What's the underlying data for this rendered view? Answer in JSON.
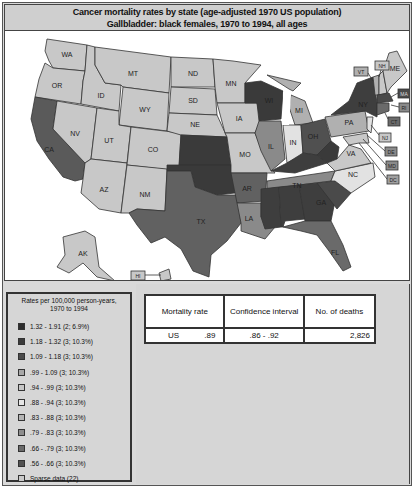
{
  "title": {
    "line1": "Cancer mortality rates by state (age-adjusted 1970 US population)",
    "line2": "Gallbladder:  black females, 1970 to 1994, all ages"
  },
  "colors": {
    "bin1": "#3a3a3a",
    "bin2": "#454545",
    "bin3": "#555555",
    "bin4": "#a6a6a6",
    "bin5": "#c4c4c4",
    "bin6": "#dedede",
    "bin7": "#b0b0b0",
    "bin8": "#8c8c8c",
    "bin9": "#6a6a6a",
    "bin10": "#505050",
    "sparse": "#c8c8c8",
    "background": "#d9d9d9"
  },
  "legend": {
    "title_line1": "Rates per 100,000 person-years,",
    "title_line2": "1970 to 1994",
    "items": [
      {
        "label": "1.32 - 1.91 (2; 6.9%)",
        "color": "#2e2e2e"
      },
      {
        "label": "1.18 - 1.32 (3; 10.3%)",
        "color": "#3c3c3c"
      },
      {
        "label": "1.09 - 1.18 (3; 10.3%)",
        "color": "#4c4c4c"
      },
      {
        "label": ".99 - 1.09 (3; 10.3%)",
        "color": "#a8a8a8"
      },
      {
        "label": ".94 - .99 (3; 10.3%)",
        "color": "#c6c6c6"
      },
      {
        "label": ".88 - .94 (3; 10.3%)",
        "color": "#e6e6e6"
      },
      {
        "label": ".83 - .88 (3; 10.3%)",
        "color": "#b4b4b4"
      },
      {
        "label": ".79 - .83 (3; 10.3%)",
        "color": "#8e8e8e"
      },
      {
        "label": ".66 - .79 (3; 10.3%)",
        "color": "#6a6a6a"
      },
      {
        "label": ".56 - .66 (3; 10.3%)",
        "color": "#525252"
      },
      {
        "label": "Sparse data (22)",
        "color": "#cacaca"
      }
    ]
  },
  "stats": {
    "headers": {
      "rate": "Mortality rate",
      "ci": "Confidence interval",
      "deaths": "No. of deaths"
    },
    "row": {
      "region": "US",
      "rate": ".89",
      "ci": ".86 - .92",
      "deaths": "2,826"
    }
  },
  "map": {
    "states": [
      {
        "abbr": "WA"
      },
      {
        "abbr": "OR"
      },
      {
        "abbr": "CA"
      },
      {
        "abbr": "ID"
      },
      {
        "abbr": "NV"
      },
      {
        "abbr": "MT"
      },
      {
        "abbr": "WY"
      },
      {
        "abbr": "UT"
      },
      {
        "abbr": "AZ"
      },
      {
        "abbr": "CO"
      },
      {
        "abbr": "NM"
      },
      {
        "abbr": "ND"
      },
      {
        "abbr": "SD"
      },
      {
        "abbr": "NE"
      },
      {
        "abbr": "KS"
      },
      {
        "abbr": "OK"
      },
      {
        "abbr": "TX"
      },
      {
        "abbr": "MN"
      },
      {
        "abbr": "IA"
      },
      {
        "abbr": "MO"
      },
      {
        "abbr": "AR"
      },
      {
        "abbr": "LA"
      },
      {
        "abbr": "WI"
      },
      {
        "abbr": "IL"
      },
      {
        "abbr": "MI"
      },
      {
        "abbr": "IN"
      },
      {
        "abbr": "OH"
      },
      {
        "abbr": "KY"
      },
      {
        "abbr": "TN"
      },
      {
        "abbr": "MS"
      },
      {
        "abbr": "AL"
      },
      {
        "abbr": "GA"
      },
      {
        "abbr": "FL"
      },
      {
        "abbr": "SC"
      },
      {
        "abbr": "NC"
      },
      {
        "abbr": "VA"
      },
      {
        "abbr": "WV"
      },
      {
        "abbr": "PA"
      },
      {
        "abbr": "NY"
      },
      {
        "abbr": "VT"
      },
      {
        "abbr": "NH"
      },
      {
        "abbr": "ME"
      },
      {
        "abbr": "MA"
      },
      {
        "abbr": "RI"
      },
      {
        "abbr": "CT"
      },
      {
        "abbr": "NJ"
      },
      {
        "abbr": "DE"
      },
      {
        "abbr": "MD"
      },
      {
        "abbr": "DC"
      },
      {
        "abbr": "AK"
      },
      {
        "abbr": "HI"
      }
    ],
    "callouts": [
      "VT",
      "NH",
      "MA",
      "RI",
      "CT",
      "NJ",
      "DE",
      "MD",
      "DC",
      "HI"
    ]
  }
}
